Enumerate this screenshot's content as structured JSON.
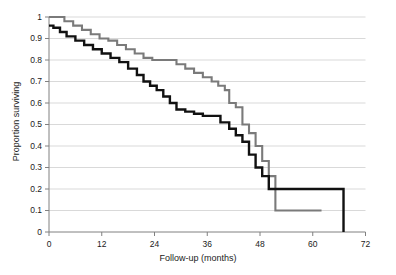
{
  "chart_data": {
    "type": "line",
    "subtype": "kaplan-meier-step",
    "title": "",
    "xlabel": "Follow-up (months)",
    "ylabel": "Proportion surviving",
    "xlim": [
      0,
      72
    ],
    "ylim": [
      0,
      1
    ],
    "xticks": [
      0,
      12,
      24,
      36,
      48,
      60,
      72
    ],
    "xtick_labels": [
      "0",
      "12",
      "24",
      "36",
      "48",
      "60",
      "72"
    ],
    "yticks": [
      0,
      0.1,
      0.2,
      0.3,
      0.4,
      0.5,
      0.6,
      0.7,
      0.8,
      0.9,
      1
    ],
    "ytick_labels": [
      "0",
      "0.1",
      "0.2",
      "0.3",
      "0.4",
      "0.5",
      "0.6",
      "0.7",
      "0.8",
      "0.9",
      "1"
    ],
    "grid": {
      "horizontal": true,
      "vertical": false,
      "color": "#c8c8c8"
    },
    "legend": {
      "visible": false,
      "position": "none"
    },
    "axis_color": "#808080",
    "series": [
      {
        "name": "group-gray",
        "color": "#7a7a7a",
        "line_width": 2.1,
        "x": [
          0,
          1.5,
          3.5,
          5.5,
          7.5,
          9.5,
          11.5,
          13.5,
          15.5,
          17.5,
          19.5,
          21.5,
          23.5,
          26.0,
          29.0,
          31.0,
          33.0,
          35.0,
          37.0,
          38.5,
          40.0,
          41.0,
          42.5,
          44.0,
          45.5,
          47.0,
          48.5,
          50.0,
          51.5,
          62.0
        ],
        "y": [
          1.0,
          1.0,
          0.98,
          0.96,
          0.94,
          0.92,
          0.9,
          0.89,
          0.87,
          0.85,
          0.83,
          0.81,
          0.8,
          0.8,
          0.78,
          0.76,
          0.74,
          0.72,
          0.7,
          0.68,
          0.66,
          0.6,
          0.58,
          0.5,
          0.46,
          0.4,
          0.33,
          0.26,
          0.1,
          0.1
        ]
      },
      {
        "name": "group-black",
        "color": "#111111",
        "line_width": 2.4,
        "x": [
          0,
          1.0,
          2.5,
          4.0,
          6.0,
          8.0,
          10.0,
          12.0,
          14.0,
          16.0,
          18.0,
          20.0,
          21.5,
          23.0,
          24.5,
          26.0,
          27.5,
          29.0,
          31.0,
          33.0,
          35.0,
          37.0,
          39.0,
          41.0,
          42.5,
          44.0,
          45.5,
          47.0,
          48.5,
          50.0,
          67.0
        ],
        "y": [
          0.96,
          0.95,
          0.93,
          0.91,
          0.89,
          0.87,
          0.85,
          0.83,
          0.81,
          0.79,
          0.76,
          0.73,
          0.7,
          0.68,
          0.66,
          0.63,
          0.6,
          0.57,
          0.56,
          0.55,
          0.54,
          0.54,
          0.51,
          0.48,
          0.45,
          0.42,
          0.36,
          0.3,
          0.26,
          0.2,
          0.0
        ]
      }
    ]
  }
}
